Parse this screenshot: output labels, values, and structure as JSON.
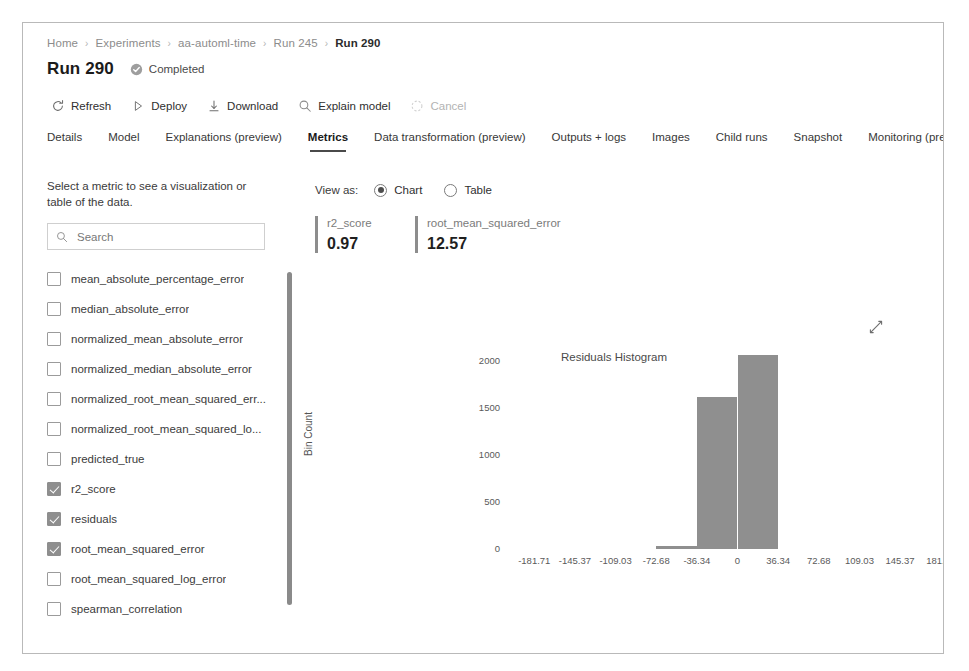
{
  "breadcrumb": {
    "items": [
      {
        "label": "Home",
        "current": false
      },
      {
        "label": "Experiments",
        "current": false
      },
      {
        "label": "aa-automl-time",
        "current": false
      },
      {
        "label": "Run 245",
        "current": false
      },
      {
        "label": "Run 290",
        "current": true
      }
    ],
    "separator": "›"
  },
  "header": {
    "title": "Run 290",
    "status": "Completed",
    "status_icon": "check-circle-icon"
  },
  "toolbar": {
    "items": [
      {
        "label": "Refresh",
        "icon": "refresh-icon",
        "disabled": false
      },
      {
        "label": "Deploy",
        "icon": "play-triangle-icon",
        "disabled": false
      },
      {
        "label": "Download",
        "icon": "download-arrow-icon",
        "disabled": false
      },
      {
        "label": "Explain model",
        "icon": "magnifier-icon",
        "disabled": false
      },
      {
        "label": "Cancel",
        "icon": "cancel-icon",
        "disabled": true
      }
    ]
  },
  "tabs": {
    "items": [
      {
        "label": "Details",
        "active": false
      },
      {
        "label": "Model",
        "active": false
      },
      {
        "label": "Explanations (preview)",
        "active": false
      },
      {
        "label": "Metrics",
        "active": true
      },
      {
        "label": "Data transformation (preview)",
        "active": false
      },
      {
        "label": "Outputs + logs",
        "active": false
      },
      {
        "label": "Images",
        "active": false
      },
      {
        "label": "Child runs",
        "active": false
      },
      {
        "label": "Snapshot",
        "active": false
      },
      {
        "label": "Monitoring (preview)",
        "active": false
      }
    ]
  },
  "sidebar": {
    "hint": "Select a metric to see a visualization or table of the data.",
    "search": {
      "value": "",
      "placeholder": "Search",
      "icon": "search-icon"
    },
    "metrics": [
      {
        "label": "mean_absolute_percentage_error",
        "checked": false
      },
      {
        "label": "median_absolute_error",
        "checked": false
      },
      {
        "label": "normalized_mean_absolute_error",
        "checked": false
      },
      {
        "label": "normalized_median_absolute_error",
        "checked": false
      },
      {
        "label": "normalized_root_mean_squared_err...",
        "checked": false
      },
      {
        "label": "normalized_root_mean_squared_lo...",
        "checked": false
      },
      {
        "label": "predicted_true",
        "checked": false
      },
      {
        "label": "r2_score",
        "checked": true
      },
      {
        "label": "residuals",
        "checked": true
      },
      {
        "label": "root_mean_squared_error",
        "checked": true
      },
      {
        "label": "root_mean_squared_log_error",
        "checked": false
      },
      {
        "label": "spearman_correlation",
        "checked": false
      }
    ]
  },
  "view_as": {
    "label": "View as:",
    "options": [
      {
        "label": "Chart",
        "selected": true
      },
      {
        "label": "Table",
        "selected": false
      }
    ]
  },
  "metric_cards": [
    {
      "name": "r2_score",
      "value": "0.97"
    },
    {
      "name": "root_mean_squared_error",
      "value": "12.57"
    }
  ],
  "chart_actions": {
    "expand_icon": "expand-diagonal-icon"
  },
  "chart_data": {
    "type": "bar",
    "title": "Residuals Histogram",
    "xlabel": "",
    "ylabel": "Bin Count",
    "grid": false,
    "legend": false,
    "xtick_labels": [
      "-181.71",
      "-145.37",
      "-109.03",
      "-72.68",
      "-36.34",
      "0",
      "36.34",
      "72.68",
      "109.03",
      "145.37",
      "181.71"
    ],
    "xtick_values": [
      -181.71,
      -145.37,
      -109.03,
      -72.68,
      -36.34,
      0,
      36.34,
      72.68,
      109.03,
      145.37,
      181.71
    ],
    "ytick_labels": [
      "0",
      "500",
      "1000",
      "1500",
      "2000"
    ],
    "ytick_values": [
      0,
      500,
      1000,
      1500,
      2000
    ],
    "xlim": [
      -199.87,
      199.87
    ],
    "ylim": [
      0,
      2180
    ],
    "bin_width": 36.34,
    "bars": [
      {
        "bin_start": -72.68,
        "bin_end": -36.34,
        "value": 30
      },
      {
        "bin_start": -36.34,
        "bin_end": 0,
        "value": 1620
      },
      {
        "bin_start": 0,
        "bin_end": 36.34,
        "value": 2060
      }
    ],
    "bar_color": "#8f8f8f"
  }
}
